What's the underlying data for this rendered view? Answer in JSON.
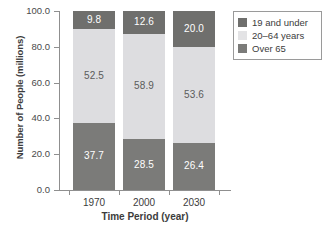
{
  "chart_data": {
    "type": "bar",
    "subtype": "stacked-vertical",
    "title": "",
    "xlabel": "Time Period (year)",
    "ylabel": "Number of People (millions)",
    "categories": [
      "1970",
      "2000",
      "2030"
    ],
    "xtick_labels": [
      "1970",
      "2000",
      "2030"
    ],
    "ytick_labels": [
      "0.0",
      "20.0",
      "40.0",
      "60.0",
      "80.0",
      "100.0"
    ],
    "ytick_values": [
      0,
      20,
      40,
      60,
      80,
      100
    ],
    "ylim": [
      0,
      100
    ],
    "grid": false,
    "legend_position": "upper right",
    "stack_order_bottom_to_top": [
      "Over 65",
      "20–64 years",
      "19 and under"
    ],
    "series": [
      {
        "name": "Over 65",
        "color": "#7b7b79",
        "text_color": "#ffffff",
        "values": [
          37.7,
          28.5,
          26.4
        ],
        "labels": [
          "37.7",
          "28.5",
          "26.4"
        ]
      },
      {
        "name": "20–64 years",
        "color": "#dddde0",
        "text_color": "#5b5b5b",
        "values": [
          52.5,
          58.9,
          53.6
        ],
        "labels": [
          "52.5",
          "58.9",
          "53.6"
        ]
      },
      {
        "name": "19 and under",
        "color": "#6f6f6d",
        "text_color": "#ffffff",
        "values": [
          9.8,
          12.6,
          20.0
        ],
        "labels": [
          "9.8",
          "12.6",
          "20.0"
        ]
      }
    ],
    "legend": [
      {
        "label": "19 and under",
        "color": "#6f6f6d"
      },
      {
        "label": "20–64 years",
        "color": "#e3e3e5"
      },
      {
        "label": "Over 65",
        "color": "#7b7b79"
      }
    ]
  },
  "axis": {
    "line_color": "#8f8f8f"
  }
}
